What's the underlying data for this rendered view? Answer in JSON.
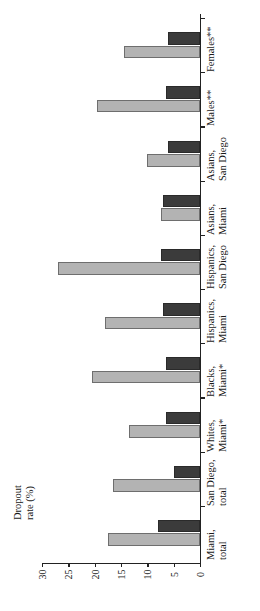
{
  "chart_data": {
    "type": "bar",
    "title": "",
    "orientation": "horizontal-rotated",
    "xlabel": "",
    "ylabel": "Dropout\nrate (%)",
    "ylim": [
      0,
      30
    ],
    "yticks": [
      30,
      25,
      20,
      15,
      10,
      5,
      0
    ],
    "grid": false,
    "legend": "none",
    "categories": [
      "Miami,\ntotal",
      "San Diego,\ntotal",
      "Whites,\nMiami*",
      "Blacks,\nMiami*",
      "Hispanics,\nMiami",
      "Hispanics,\nSan Diego",
      "Asians,\nMiami",
      "Asians,\nSan Diego",
      "Males**",
      "Females**"
    ],
    "series": [
      {
        "name": "light-series",
        "color": "#b3b3b3",
        "values": [
          17.5,
          16.5,
          13.5,
          20.5,
          18.0,
          27.0,
          7.5,
          10.0,
          19.5,
          14.5
        ]
      },
      {
        "name": "dark-series",
        "color": "#3b3b3b",
        "values": [
          8.0,
          5.0,
          6.5,
          6.5,
          7.0,
          7.5,
          7.0,
          6.0,
          6.5,
          6.0
        ]
      }
    ]
  },
  "axis": {
    "value_axis_title": "Dropout\nrate (%)",
    "tick_labels": [
      "30",
      "25",
      "20",
      "15",
      "10",
      "5",
      "0"
    ]
  },
  "category_labels": [
    "Miami,\ntotal",
    "San Diego,\ntotal",
    "Whites,\nMiami*",
    "Blacks,\nMiami*",
    "Hispanics,\nMiami",
    "Hispanics,\nSan Diego",
    "Asians,\nMiami",
    "Asians,\nSan Diego",
    "Males**",
    "Females**"
  ]
}
